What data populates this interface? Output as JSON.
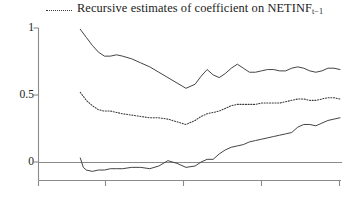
{
  "legend": {
    "swatch_style": "dotted-line",
    "text_before_sub": "Recursive estimates of coefficient on NETINF",
    "subscript": "t−1",
    "full_text": "Recursive estimates of coefficient on NETINF t−1"
  },
  "axes": {
    "y_ticks": [
      "1",
      "0.5",
      "0"
    ],
    "x_ticks": [
      "",
      "",
      "",
      "",
      ""
    ],
    "zero_line": "0"
  },
  "colors": {
    "line": "#3a3a3a",
    "axis": "#8a8a8a",
    "background": "#ffffff",
    "text": "#1b1b1b"
  },
  "chart_data": {
    "type": "line",
    "title": "",
    "subtitle": "",
    "xlabel": "",
    "ylabel": "",
    "legend_position": "top",
    "grid": false,
    "ylim": [
      -0.15,
      1.05
    ],
    "yticks": [
      0,
      0.5,
      1
    ],
    "ytick_labels": [
      "0",
      "0.5",
      "1"
    ],
    "xlim": [
      0,
      100
    ],
    "xticks": [
      0,
      22,
      48,
      74,
      100
    ],
    "xtick_labels": [
      "",
      "",
      "",
      "",
      ""
    ],
    "annotations": [
      "zero reference line at y = 0"
    ],
    "series": [
      {
        "name": "Upper confidence band",
        "style": "solid",
        "x": [
          14,
          16,
          18,
          20,
          22,
          24,
          26,
          28,
          31,
          34,
          37,
          40,
          43,
          46,
          49,
          52,
          54,
          56,
          58,
          60,
          62,
          64,
          66,
          68,
          70,
          72,
          74,
          76,
          78,
          80,
          82,
          84,
          86,
          88,
          90,
          92,
          94,
          96,
          98,
          100
        ],
        "y": [
          0.99,
          0.93,
          0.87,
          0.82,
          0.79,
          0.79,
          0.8,
          0.79,
          0.77,
          0.74,
          0.71,
          0.67,
          0.63,
          0.59,
          0.55,
          0.58,
          0.64,
          0.69,
          0.65,
          0.63,
          0.66,
          0.7,
          0.73,
          0.7,
          0.67,
          0.67,
          0.68,
          0.69,
          0.69,
          0.68,
          0.68,
          0.7,
          0.71,
          0.7,
          0.68,
          0.67,
          0.68,
          0.7,
          0.7,
          0.69
        ]
      },
      {
        "name": "Recursive point estimate",
        "style": "dotted",
        "x": [
          14,
          16,
          18,
          20,
          22,
          24,
          26,
          28,
          31,
          34,
          37,
          40,
          43,
          46,
          49,
          52,
          54,
          56,
          58,
          60,
          62,
          64,
          66,
          68,
          70,
          72,
          74,
          76,
          78,
          80,
          82,
          84,
          86,
          88,
          90,
          92,
          94,
          96,
          98,
          100
        ],
        "y": [
          0.52,
          0.46,
          0.42,
          0.39,
          0.38,
          0.38,
          0.37,
          0.36,
          0.35,
          0.34,
          0.33,
          0.33,
          0.32,
          0.3,
          0.28,
          0.31,
          0.34,
          0.36,
          0.37,
          0.38,
          0.4,
          0.42,
          0.43,
          0.43,
          0.43,
          0.43,
          0.44,
          0.44,
          0.44,
          0.44,
          0.45,
          0.46,
          0.47,
          0.47,
          0.46,
          0.46,
          0.47,
          0.48,
          0.48,
          0.47
        ]
      },
      {
        "name": "Lower confidence band",
        "style": "solid",
        "x": [
          14,
          15,
          16,
          18,
          20,
          22,
          24,
          26,
          28,
          31,
          34,
          37,
          40,
          43,
          46,
          49,
          52,
          54,
          56,
          58,
          60,
          62,
          64,
          66,
          68,
          70,
          72,
          74,
          76,
          78,
          80,
          82,
          84,
          86,
          88,
          90,
          92,
          94,
          96,
          98,
          100
        ],
        "y": [
          0.03,
          -0.04,
          -0.06,
          -0.07,
          -0.06,
          -0.06,
          -0.05,
          -0.05,
          -0.05,
          -0.04,
          -0.04,
          -0.05,
          -0.03,
          0.01,
          -0.01,
          -0.04,
          -0.03,
          0.0,
          0.02,
          0.02,
          0.06,
          0.09,
          0.11,
          0.12,
          0.13,
          0.15,
          0.16,
          0.17,
          0.18,
          0.19,
          0.2,
          0.21,
          0.22,
          0.26,
          0.28,
          0.28,
          0.27,
          0.29,
          0.31,
          0.32,
          0.33
        ]
      }
    ]
  }
}
